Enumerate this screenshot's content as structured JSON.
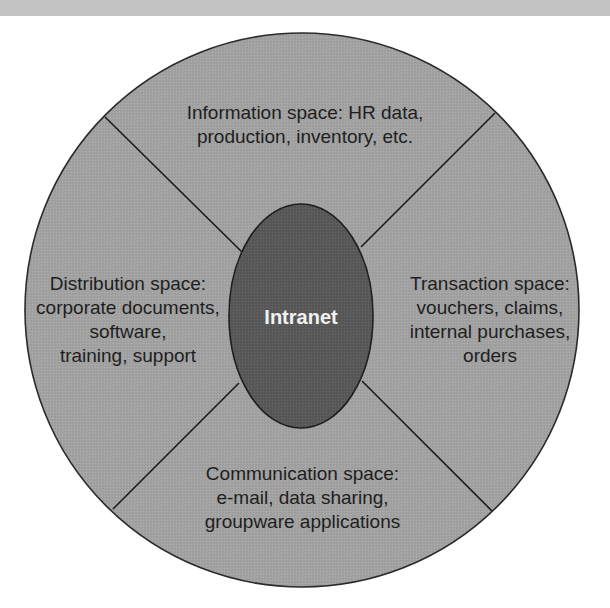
{
  "diagram": {
    "center": {
      "label": "Intranet"
    },
    "segments": [
      {
        "id": "information",
        "position": "top",
        "lines": [
          "Information space: HR data,",
          "production, inventory, etc."
        ]
      },
      {
        "id": "transaction",
        "position": "right",
        "lines": [
          "Transaction space:",
          "vouchers, claims,",
          "internal purchases,",
          "orders"
        ]
      },
      {
        "id": "communication",
        "position": "bottom",
        "lines": [
          "Communication space:",
          "e-mail, data sharing,",
          "groupware applications"
        ]
      },
      {
        "id": "distribution",
        "position": "left",
        "lines": [
          "Distribution space:",
          "corporate documents,",
          "software,",
          "training, support"
        ]
      }
    ],
    "colors": {
      "circle_fill": "#a3a3a3",
      "circle_stroke": "#2a2a2a",
      "ellipse_fill": "#5a5a5a",
      "ellipse_stroke": "#1e1e1e",
      "text": "#1e1e1e",
      "center_text": "#f2f2f2",
      "banner": "#c4c4c4"
    }
  }
}
